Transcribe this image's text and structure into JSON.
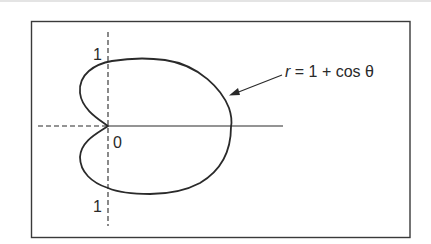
{
  "figure": {
    "equation_label": "r = 1 + cos θ",
    "equation_parts": {
      "var": "r",
      "rest": " = 1 + cos θ"
    },
    "axis_labels": {
      "top": "1",
      "bottom": "1",
      "origin": "0"
    },
    "curve_type": "cardioid",
    "colors": {
      "stroke": "#2a2a2a",
      "frame": "#3a3a3a",
      "background": "#ffffff"
    }
  }
}
